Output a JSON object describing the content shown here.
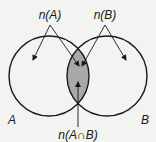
{
  "diagram": {
    "type": "venn",
    "sets": [
      {
        "name": "A",
        "label": "A"
      },
      {
        "name": "B",
        "label": "B"
      }
    ],
    "annotations": {
      "n_a": "n(A)",
      "n_b": "n(B)",
      "n_intersection": "n(A∩B)"
    },
    "colors": {
      "background": "#f3f3f1",
      "outline": "#1a1a1a",
      "intersection_fill": "#a9a9a9"
    }
  }
}
